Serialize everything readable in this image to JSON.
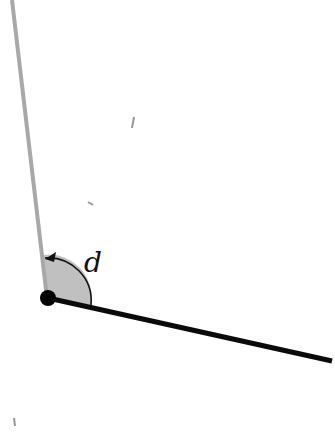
{
  "diagram": {
    "angle_label": "d",
    "colors": {
      "ray_gray": "#a8a8a8",
      "ray_black": "#0a0a0a",
      "sector_fill": "#c0c0c0",
      "vertex": "#000000"
    },
    "vertex": [
      48,
      298
    ],
    "ray_gray_end": [
      12,
      0
    ],
    "ray_black_end": [
      332,
      361
    ]
  }
}
